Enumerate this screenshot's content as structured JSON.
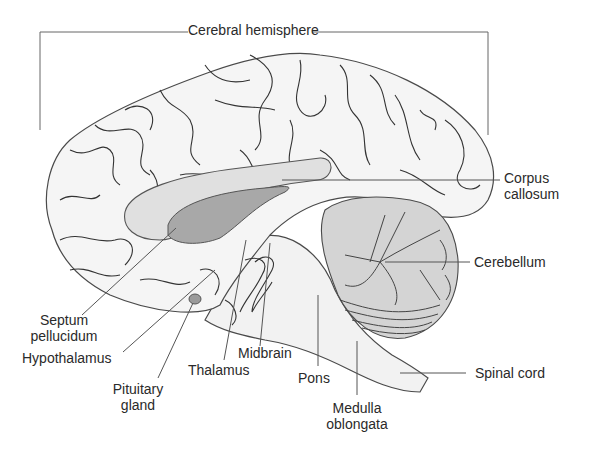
{
  "diagram": {
    "title": "Cerebral hemisphere",
    "labels": {
      "cerebral_hemisphere": "Cerebral hemisphere",
      "corpus_callosum": [
        "Corpus",
        "callosum"
      ],
      "cerebellum": "Cerebellum",
      "septum_pellucidum": [
        "Septum",
        "pellucidum"
      ],
      "hypothalamus": "Hypothalamus",
      "pituitary_gland": [
        "Pituitary",
        "gland"
      ],
      "thalamus": "Thalamus",
      "midbrain": "Midbrain",
      "pons": "Pons",
      "medulla_oblongata": [
        "Medulla",
        "oblongata"
      ],
      "spinal_cord": "Spinal cord"
    },
    "colors": {
      "outline": "#4a4a4a",
      "brain_fill": "#f4f4f4",
      "corpus_callosum_fill": "#e0e0e0",
      "septum_fill": "#a8a8a8",
      "cerebellum_fill": "#d4d4d4",
      "pituitary_fill": "#9a9a9a",
      "leader_line": "#555555"
    }
  }
}
